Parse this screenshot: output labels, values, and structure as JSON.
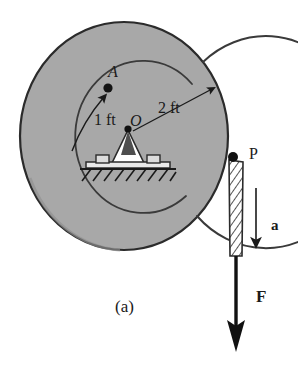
{
  "figure": {
    "caption": "(a)",
    "background_color": "#ffffff",
    "disc_fill": "#a8a8a8",
    "disc_stroke": "#2b2b2b",
    "ink_color": "#1a1a1a",
    "hub_fill": "#ffffff"
  },
  "labels": {
    "point_a": "A",
    "point_o": "O",
    "point_p": "P",
    "radius_inner": "1 ft",
    "radius_outer": "2 ft",
    "acceleration": "a",
    "force": "F"
  },
  "diagram_data": {
    "type": "engineering-free-body-diagram",
    "title": "Disc (spool) on a rigid support with cord at P",
    "body": {
      "name": "spool",
      "shape": "circular disc",
      "outer_radius_ft": 2,
      "inner_radius_ft": 1,
      "center_label": "O"
    },
    "points": [
      {
        "label": "A",
        "description": "point on inner radius circle",
        "radius_ft": 1
      },
      {
        "label": "O",
        "description": "center of disc, pin support",
        "radius_ft": 0
      },
      {
        "label": "P",
        "description": "point on outer rim where cord leaves disc",
        "radius_ft": 2
      }
    ],
    "dimensions": [
      {
        "label": "1 ft",
        "from": "O",
        "to": "inner circle",
        "value": 1,
        "unit": "ft"
      },
      {
        "label": "2 ft",
        "from": "O",
        "to": "outer rim",
        "value": 2,
        "unit": "ft"
      }
    ],
    "vectors": [
      {
        "label": "a",
        "kind": "acceleration",
        "direction": "downward",
        "style": "thin-arrow"
      },
      {
        "label": "F",
        "kind": "force",
        "direction": "downward",
        "style": "thick-arrow",
        "applied_at": "end of cord below P"
      }
    ],
    "supports": [
      {
        "type": "pin/bearing on base plate",
        "location": "O",
        "ground": "hatched fixed ground"
      }
    ],
    "cord": {
      "from": "P",
      "to": "F arrow tail",
      "hatched": true
    }
  }
}
